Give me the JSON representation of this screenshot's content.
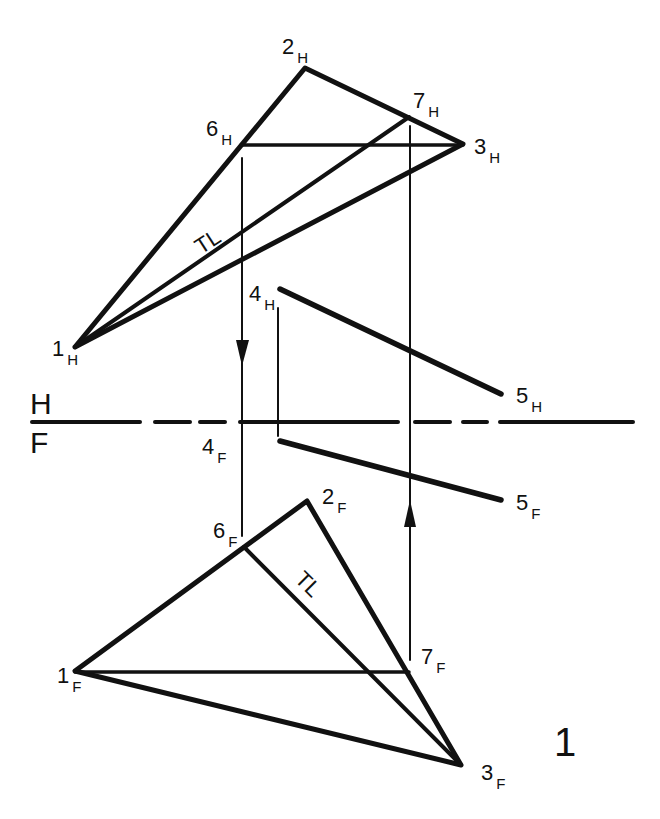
{
  "diagram": {
    "type": "descriptive geometry - true length construction (horizontal & frontal views)",
    "figure_number": "1",
    "planes": {
      "upper": "H",
      "lower": "F"
    },
    "tl_label": "TL",
    "points": {
      "1H": {
        "num": "1",
        "sub": "H"
      },
      "2H": {
        "num": "2",
        "sub": "H"
      },
      "3H": {
        "num": "3",
        "sub": "H"
      },
      "4H": {
        "num": "4",
        "sub": "H"
      },
      "5H": {
        "num": "5",
        "sub": "H"
      },
      "6H": {
        "num": "6",
        "sub": "H"
      },
      "7H": {
        "num": "7",
        "sub": "H"
      },
      "1F": {
        "num": "1",
        "sub": "F"
      },
      "2F": {
        "num": "2",
        "sub": "F"
      },
      "3F": {
        "num": "3",
        "sub": "F"
      },
      "4F": {
        "num": "4",
        "sub": "F"
      },
      "5F": {
        "num": "5",
        "sub": "F"
      },
      "6F": {
        "num": "6",
        "sub": "F"
      },
      "7F": {
        "num": "7",
        "sub": "F"
      }
    },
    "stroke_color": "#111111",
    "background": "#ffffff"
  }
}
